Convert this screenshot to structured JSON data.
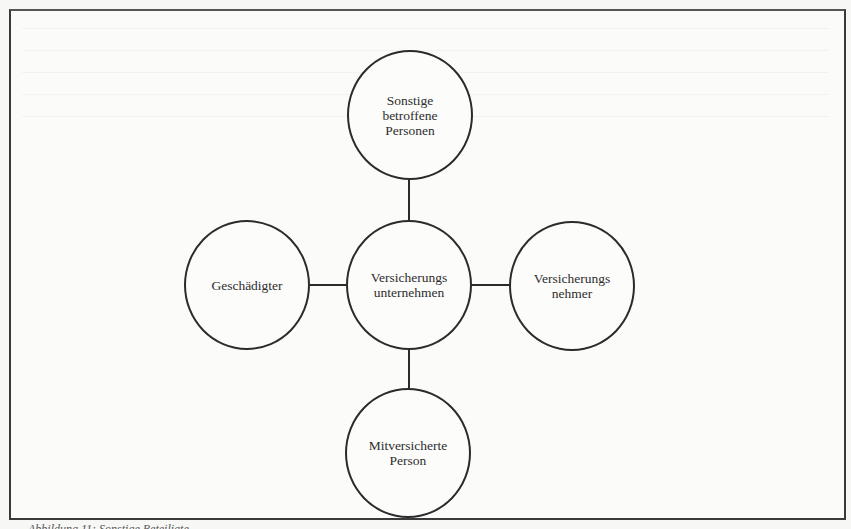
{
  "diagram": {
    "type": "hub-and-spoke",
    "line_color": "#2b2b2b",
    "center": {
      "id": "versicherungsunternehmen",
      "label": "Versicherungs\nunternehmen"
    },
    "nodes": {
      "top": {
        "id": "sonstige-betroffene-personen",
        "label": "Sonstige\nbetroffene\nPersonen"
      },
      "left": {
        "id": "geschaedigter",
        "label": "Geschädigter"
      },
      "right": {
        "id": "versicherungsnehmer",
        "label": "Versicherungs\nnehmer"
      },
      "bottom": {
        "id": "mitversicherte-person",
        "label": "Mitversicherte\nPerson"
      }
    },
    "edges": [
      [
        "versicherungsunternehmen",
        "sonstige-betroffene-personen"
      ],
      [
        "versicherungsunternehmen",
        "geschaedigter"
      ],
      [
        "versicherungsunternehmen",
        "versicherungsnehmer"
      ],
      [
        "versicherungsunternehmen",
        "mitversicherte-person"
      ]
    ]
  },
  "caption": {
    "text": "Abbildung 11: Sonstige Beteiligte ..."
  }
}
